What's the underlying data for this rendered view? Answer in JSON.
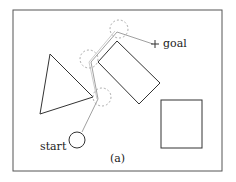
{
  "diagram": {
    "labels": {
      "start": "start",
      "goal": "goal",
      "caption": "(a)"
    },
    "colors": {
      "frame": "#555555",
      "obstacle": "#333333",
      "path": "#888888",
      "dashed_circle": "#999999",
      "text": "#222222"
    },
    "obstacles": [
      {
        "type": "triangle",
        "points": [
          [
            50,
            54
          ],
          [
            93,
            97
          ],
          [
            40,
            114
          ]
        ]
      },
      {
        "type": "rotated-rectangle",
        "points": [
          [
            117,
            41
          ],
          [
            160,
            83
          ],
          [
            139,
            104
          ],
          [
            98,
            62
          ]
        ]
      },
      {
        "type": "square",
        "x": 161,
        "y": 100,
        "width": 41,
        "height": 48
      }
    ],
    "start": {
      "cx": 77,
      "cy": 140,
      "r": 8
    },
    "goal": {
      "x": 155,
      "y": 44
    },
    "path": [
      [
        82,
        132
      ],
      [
        98,
        99
      ],
      [
        91,
        62
      ],
      [
        117,
        32
      ],
      [
        153,
        44
      ]
    ],
    "waypoint_circles": [
      {
        "cx": 102,
        "cy": 97,
        "r": 9
      },
      {
        "cx": 89,
        "cy": 59,
        "r": 9
      },
      {
        "cx": 119,
        "cy": 29,
        "r": 9
      }
    ]
  }
}
